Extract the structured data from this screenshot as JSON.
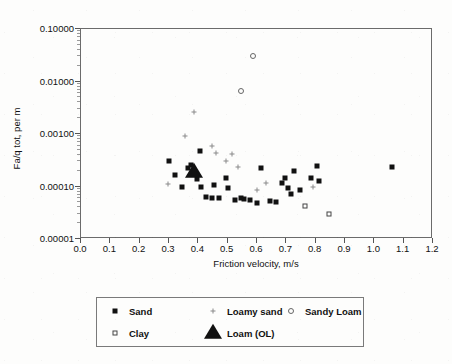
{
  "chart_data": {
    "type": "scatter",
    "title": "",
    "xlabel": "Friction velocity, m/s",
    "ylabel": "Fa/q tot, per m",
    "xlim": [
      0.0,
      1.2
    ],
    "ylim": [
      1e-05,
      0.1
    ],
    "yscale": "log",
    "xtick_labels": [
      "0.0",
      "0.1",
      "0.2",
      "0.3",
      "0.4",
      "0.5",
      "0.6",
      "0.7",
      "0.8",
      "0.9",
      "1.0",
      "1.1",
      "1.2"
    ],
    "xtick_values": [
      0.0,
      0.1,
      0.2,
      0.3,
      0.4,
      0.5,
      0.6,
      0.7,
      0.8,
      0.9,
      1.0,
      1.1,
      1.2
    ],
    "ytick_labels": [
      "0.10000",
      "0.01000",
      "0.00100",
      "0.00010",
      "0.00001"
    ],
    "ytick_values": [
      0.1,
      0.01,
      0.001,
      0.0001,
      1e-05
    ],
    "grid": false,
    "legend_position": "below-plot",
    "series": [
      {
        "name": "Sand",
        "marker": "filled-square",
        "color": "#111111",
        "points": [
          [
            0.3,
            0.0003
          ],
          [
            0.32,
            0.000165
          ],
          [
            0.345,
            0.0001
          ],
          [
            0.365,
            0.00023
          ],
          [
            0.375,
            0.000255
          ],
          [
            0.395,
            0.00014
          ],
          [
            0.405,
            0.00048
          ],
          [
            0.41,
            0.0001
          ],
          [
            0.425,
            6.2e-05
          ],
          [
            0.445,
            6e-05
          ],
          [
            0.455,
            0.000105
          ],
          [
            0.47,
            6e-05
          ],
          [
            0.495,
            0.000145
          ],
          [
            0.5,
            9.2e-05
          ],
          [
            0.525,
            5.5e-05
          ],
          [
            0.545,
            6e-05
          ],
          [
            0.555,
            5.8e-05
          ],
          [
            0.575,
            5.5e-05
          ],
          [
            0.6,
            4.8e-05
          ],
          [
            0.615,
            0.00023
          ],
          [
            0.645,
            5.2e-05
          ],
          [
            0.665,
            5e-05
          ],
          [
            0.685,
            0.000115
          ],
          [
            0.695,
            0.000145
          ],
          [
            0.705,
            9.2e-05
          ],
          [
            0.715,
            7.2e-05
          ],
          [
            0.725,
            0.0002
          ],
          [
            0.745,
            8.5e-05
          ],
          [
            0.785,
            0.000145
          ],
          [
            0.805,
            0.000245
          ],
          [
            0.81,
            0.000125
          ],
          [
            1.06,
            0.000235
          ]
        ]
      },
      {
        "name": "Loamy sand",
        "marker": "small-plus",
        "color": "#8a8a8a",
        "points": [
          [
            0.355,
            0.0009
          ],
          [
            0.385,
            0.0026
          ],
          [
            0.445,
            0.0006
          ],
          [
            0.46,
            0.00043
          ],
          [
            0.495,
            0.00031
          ],
          [
            0.515,
            0.00041
          ],
          [
            0.535,
            0.000235
          ],
          [
            0.6,
            8.5e-05
          ],
          [
            0.63,
            0.000115
          ],
          [
            0.295,
            0.00011
          ],
          [
            0.79,
            9.8e-05
          ]
        ]
      },
      {
        "name": "Sandy Loam",
        "marker": "open-circle",
        "color": "#666666",
        "points": [
          [
            0.585,
            0.03
          ],
          [
            0.545,
            0.0065
          ]
        ]
      },
      {
        "name": "Clay",
        "marker": "open-square",
        "color": "#444444",
        "points": [
          [
            0.765,
            4.2e-05
          ],
          [
            0.845,
            3e-05
          ]
        ]
      },
      {
        "name": "Loam (OL)",
        "marker": "filled-triangle",
        "color": "#111111",
        "points": [
          [
            0.385,
            0.00019
          ]
        ]
      }
    ]
  },
  "legend": {
    "items": [
      {
        "label": "Sand",
        "marker": "filled-square",
        "row": 0,
        "col": 0
      },
      {
        "label": "Loamy sand",
        "marker": "small-plus",
        "row": 0,
        "col": 1
      },
      {
        "label": "Sandy Loam",
        "marker": "open-circle",
        "row": 0,
        "col": 2
      },
      {
        "label": "Clay",
        "marker": "open-square",
        "row": 1,
        "col": 0
      },
      {
        "label": "Loam (OL)",
        "marker": "filled-triangle",
        "row": 1,
        "col": 1
      }
    ]
  }
}
